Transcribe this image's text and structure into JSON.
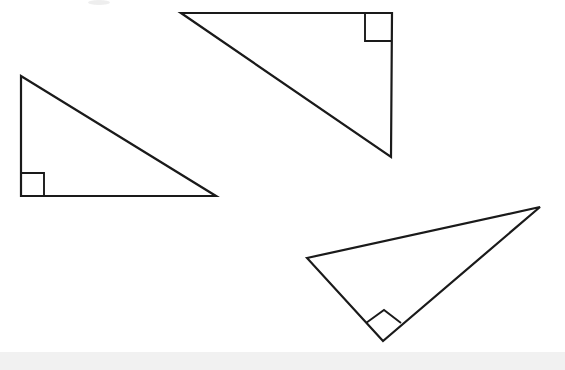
{
  "canvas": {
    "width": 565,
    "height": 370,
    "background_color": "#ffffff",
    "stroke_color": "#1a1a1a",
    "stroke_width": 2.2,
    "fill_color": "#ffffff"
  },
  "figure": {
    "shape_count": 3,
    "shape_type": "right-triangle"
  },
  "shapes": [
    {
      "id": "triangle-left",
      "name": "left-right-triangle",
      "points": "21,76 21,196 216,196",
      "vertices": [
        {
          "label": "top",
          "x": 21,
          "y": 76
        },
        {
          "label": "bottom-left",
          "x": 21,
          "y": 196
        },
        {
          "label": "bottom-right",
          "x": 216,
          "y": 196
        }
      ],
      "right_angle_vertex": "bottom-left",
      "right_angle_mark": "44,196 44,173 21,173",
      "orientation": "right angle at lower left, hypotenuse from top-left to bottom-right"
    },
    {
      "id": "triangle-top",
      "name": "top-right-triangle",
      "points": "181,13 392,13 391,157",
      "vertices": [
        {
          "label": "top-left",
          "x": 181,
          "y": 13
        },
        {
          "label": "top-right",
          "x": 392,
          "y": 13
        },
        {
          "label": "bottom",
          "x": 391,
          "y": 157
        }
      ],
      "right_angle_vertex": "top-right",
      "right_angle_mark": "365,13 365,41 392,41",
      "orientation": "right angle at upper right, hypotenuse from top-left down to bottom"
    },
    {
      "id": "triangle-bottom-right",
      "name": "bottom-right-triangle",
      "points": "307,258 540,207 383,341",
      "vertices": [
        {
          "label": "left",
          "x": 307,
          "y": 258
        },
        {
          "label": "right",
          "x": 540,
          "y": 207
        },
        {
          "label": "bottom",
          "x": 383,
          "y": 341
        }
      ],
      "right_angle_vertex": "bottom",
      "right_angle_mark": "366,323 384,310 401,323",
      "orientation": "rotated triangle, right angle at bottom vertex, marker drawn as tilted square"
    }
  ],
  "footer_band": {
    "name": "bottom-gray-band",
    "color": "#f1f1f1",
    "y": 352,
    "height": 18
  },
  "top_smudge": {
    "name": "top-artifact-smudge",
    "color": "#ebebeb",
    "x": 88,
    "y": 0,
    "width": 22,
    "height": 5
  }
}
